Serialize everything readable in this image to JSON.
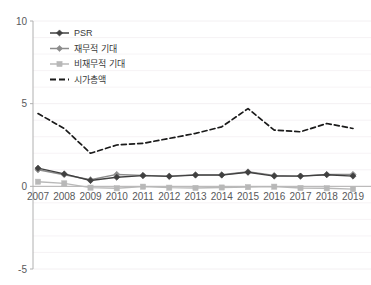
{
  "chart_data": {
    "type": "line",
    "title": "",
    "xlabel": "",
    "ylabel": "",
    "categories": [
      "2007",
      "2008",
      "2009",
      "2010",
      "2011",
      "2012",
      "2013",
      "2014",
      "2015",
      "2016",
      "2017",
      "2018",
      "2019"
    ],
    "ylim": [
      -5,
      10
    ],
    "yticks": [
      "10",
      "5",
      "0",
      "-5"
    ],
    "ytick_values": [
      10,
      5,
      0,
      -5
    ],
    "grid": true,
    "grid_orientation": "horizontal-minor",
    "legend_position": "top-left",
    "series": [
      {
        "name": "PSR",
        "color": "#404040",
        "marker": "diamond",
        "dash": false,
        "values": [
          1.1,
          0.75,
          0.35,
          0.55,
          0.65,
          0.6,
          0.68,
          0.68,
          0.85,
          0.62,
          0.62,
          0.7,
          0.62
        ]
      },
      {
        "name": "재무적 기대",
        "color": "#8c8c8c",
        "marker": "diamond",
        "dash": false,
        "values": [
          1.0,
          0.7,
          0.4,
          0.72,
          0.66,
          0.62,
          0.7,
          0.7,
          0.88,
          0.66,
          0.62,
          0.72,
          0.72
        ]
      },
      {
        "name": "비재무적 기대",
        "color": "#b8b8b8",
        "marker": "square",
        "dash": false,
        "values": [
          0.28,
          0.18,
          -0.08,
          -0.12,
          -0.02,
          -0.08,
          -0.1,
          -0.07,
          -0.05,
          -0.02,
          -0.1,
          -0.12,
          -0.17
        ]
      },
      {
        "name": "시가총액",
        "color": "#1a1a1a",
        "marker": "none",
        "dash": true,
        "values": [
          4.4,
          3.5,
          2.0,
          2.5,
          2.6,
          2.9,
          3.2,
          3.6,
          4.7,
          3.4,
          3.3,
          3.8,
          3.5
        ]
      }
    ]
  },
  "axes": {
    "y_top_label": "10",
    "y_mid_label": "5",
    "y_zero_label": "0",
    "y_bottom_label": "-5"
  },
  "legend": {
    "items": [
      {
        "label": "PSR"
      },
      {
        "label": "재무적 기대"
      },
      {
        "label": "비재무적 기대"
      },
      {
        "label": "시가총액"
      }
    ]
  },
  "colors": {
    "psr": "#404040",
    "financial": "#8c8c8c",
    "nonfinancial": "#b8b8b8",
    "marketcap": "#1a1a1a",
    "axis": "#b0b0b0",
    "grid": "#f2eef0",
    "text": "#58595b"
  }
}
